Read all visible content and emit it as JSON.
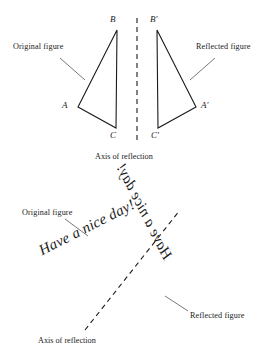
{
  "figure": {
    "title_kind": "reflection-diagram",
    "stroke_color": "#1a1a1a",
    "background_color": "#ffffff"
  },
  "top_panel": {
    "original_label": "Original figure",
    "reflected_label": "Reflected figure",
    "axis_caption": "Axis of reflection",
    "original_triangle": {
      "vertices": [
        {
          "name": "A",
          "label": "A",
          "x": 78,
          "y": 107
        },
        {
          "name": "B",
          "label": "B",
          "x": 117,
          "y": 30
        },
        {
          "name": "C",
          "label": "C",
          "x": 116,
          "y": 128
        }
      ]
    },
    "reflected_triangle": {
      "vertices": [
        {
          "name": "A'",
          "label": "A′",
          "x": 196,
          "y": 107
        },
        {
          "name": "B'",
          "label": "B′",
          "x": 157,
          "y": 30
        },
        {
          "name": "C'",
          "label": "C′",
          "x": 158,
          "y": 128
        }
      ]
    },
    "axis_line": {
      "x1": 137,
      "y1": 18,
      "x2": 137,
      "y2": 143,
      "style": "dashed"
    },
    "leader_original": {
      "x1": 60,
      "y1": 58,
      "x2": 85,
      "y2": 80
    },
    "leader_reflected": {
      "x1": 215,
      "y1": 58,
      "x2": 190,
      "y2": 80
    }
  },
  "bottom_panel": {
    "original_label": "Original figure",
    "reflected_label": "Reflected figure",
    "axis_caption": "Axis of reflection",
    "original_text": "Have a nice day!",
    "reflected_text": "Have a nice day!",
    "axis_line": {
      "x1": 85,
      "y1": 330,
      "x2": 180,
      "y2": 210,
      "style": "dashed"
    },
    "leader_original": {
      "x1": 65,
      "y1": 219,
      "x2": 88,
      "y2": 236
    },
    "leader_reflected": {
      "x1": 188,
      "y1": 311,
      "x2": 165,
      "y2": 296
    }
  }
}
